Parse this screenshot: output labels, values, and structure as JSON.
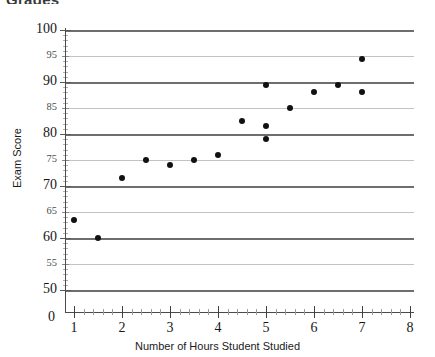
{
  "heading": "Grades",
  "chart_data": {
    "type": "scatter",
    "title": "",
    "xlabel": "Number of Hours Student Studied",
    "ylabel": "Exam Score",
    "xlim": [
      0,
      8
    ],
    "ylim": [
      50,
      100
    ],
    "grid": true,
    "legend": "none",
    "x_ticks": [
      "0",
      "1",
      "2",
      "3",
      "4",
      "5",
      "6",
      "7",
      "8"
    ],
    "y_ticks": [
      "50",
      "55",
      "60",
      "65",
      "70",
      "75",
      "80",
      "85",
      "90",
      "95",
      "100"
    ],
    "y_major_ticks": [
      "50",
      "60",
      "70",
      "80",
      "90",
      "100"
    ],
    "y_minor_ticks": [
      "55",
      "65",
      "75",
      "85",
      "95"
    ],
    "x_minor_tick_count_between": 4,
    "marker": "filled-circle",
    "marker_color": "#111111",
    "gridline_color_major": "#6e6e6e",
    "gridline_color_minor": "#c2c2c2",
    "axis_color": "#4a4a4a",
    "points": [
      {
        "x": 1,
        "y": 63.5
      },
      {
        "x": 1.5,
        "y": 60
      },
      {
        "x": 2,
        "y": 71.5
      },
      {
        "x": 2.5,
        "y": 75
      },
      {
        "x": 3,
        "y": 74
      },
      {
        "x": 3.5,
        "y": 75
      },
      {
        "x": 4,
        "y": 76
      },
      {
        "x": 4.5,
        "y": 82.5
      },
      {
        "x": 5,
        "y": 89.5
      },
      {
        "x": 5,
        "y": 81.5
      },
      {
        "x": 5,
        "y": 79
      },
      {
        "x": 5.5,
        "y": 85
      },
      {
        "x": 6,
        "y": 88
      },
      {
        "x": 6.5,
        "y": 89.5
      },
      {
        "x": 7,
        "y": 94.5
      },
      {
        "x": 7,
        "y": 88
      }
    ]
  }
}
